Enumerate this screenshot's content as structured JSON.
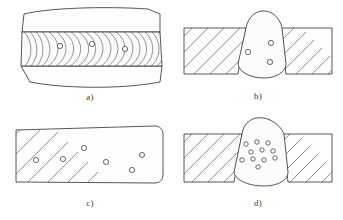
{
  "figure": {
    "panel_count": 4,
    "background_color": "#ffffff",
    "line_color": "#2b2b2b",
    "hatch_color": "#4b4b4b",
    "pore_fill_color": "#ffffff"
  },
  "panels": [
    {
      "id": "a",
      "label": "a)",
      "view": "weld-bead-surface-top-view",
      "description": "Weld bead surface with nested ripple curves and isolated pores",
      "outline_kind": "irregular-quadrilateral-plate",
      "bead_band": {
        "top_y": 30,
        "bottom_y": 64,
        "ripple_group_count": 9,
        "ripple_shape": "nested-c-curves-opening-right"
      },
      "pores": [
        {
          "cx": 52,
          "cy": 44,
          "r": 2.6
        },
        {
          "cx": 84,
          "cy": 42,
          "r": 2.6
        },
        {
          "cx": 117,
          "cy": 47,
          "r": 2.6
        }
      ],
      "pore_count": 3
    },
    {
      "id": "b",
      "label": "b)",
      "view": "butt-weld-transverse-section",
      "description": "Butt weld section, hatched parent metal either side, few scattered pores in weld nugget",
      "plate": {
        "left": 8,
        "top": 26,
        "right": 156,
        "bottom": 72
      },
      "hatch_angle_deg": 45,
      "weld_nugget_shape": "rounded-trapezoid-with-crown-and-root",
      "pores": [
        {
          "cx": 72,
          "cy": 50,
          "r": 2.6
        },
        {
          "cx": 95,
          "cy": 41,
          "r": 2.6
        },
        {
          "cx": 94,
          "cy": 60,
          "r": 2.6
        }
      ],
      "pore_count": 3
    },
    {
      "id": "c",
      "label": "c)",
      "view": "longitudinal-section-through-weld",
      "description": "Longitudinal hatched section with uniformly distributed scattered porosity",
      "plate": {
        "left": 8,
        "top": 14,
        "right": 154,
        "bottom": 72
      },
      "hatch_angle_deg": 45,
      "pores": [
        {
          "cx": 28,
          "cy": 48,
          "r": 2.6
        },
        {
          "cx": 55,
          "cy": 47,
          "r": 2.6
        },
        {
          "cx": 76,
          "cy": 36,
          "r": 2.6
        },
        {
          "cx": 98,
          "cy": 50,
          "r": 2.6
        },
        {
          "cx": 124,
          "cy": 58,
          "r": 2.6
        },
        {
          "cx": 134,
          "cy": 43,
          "r": 2.6
        }
      ],
      "pore_count": 6
    },
    {
      "id": "d",
      "label": "d)",
      "view": "butt-weld-transverse-section",
      "description": "Butt weld section with dense clustered porosity nest in weld nugget",
      "plate": {
        "left": 8,
        "top": 22,
        "right": 156,
        "bottom": 70
      },
      "hatch_angle_deg": 45,
      "weld_nugget_shape": "rounded-trapezoid-with-crown-and-root",
      "pores": [
        {
          "cx": 70,
          "cy": 32,
          "r": 2.2
        },
        {
          "cx": 81,
          "cy": 30,
          "r": 2.2
        },
        {
          "cx": 92,
          "cy": 31,
          "r": 2.2
        },
        {
          "cx": 75,
          "cy": 40,
          "r": 2.2
        },
        {
          "cx": 86,
          "cy": 38,
          "r": 2.2
        },
        {
          "cx": 97,
          "cy": 39,
          "r": 2.2
        },
        {
          "cx": 66,
          "cy": 48,
          "r": 2.2
        },
        {
          "cx": 77,
          "cy": 47,
          "r": 2.2
        },
        {
          "cx": 88,
          "cy": 48,
          "r": 2.2
        },
        {
          "cx": 99,
          "cy": 46,
          "r": 2.2
        },
        {
          "cx": 82,
          "cy": 55,
          "r": 2.2
        }
      ],
      "pore_count": 11
    }
  ]
}
